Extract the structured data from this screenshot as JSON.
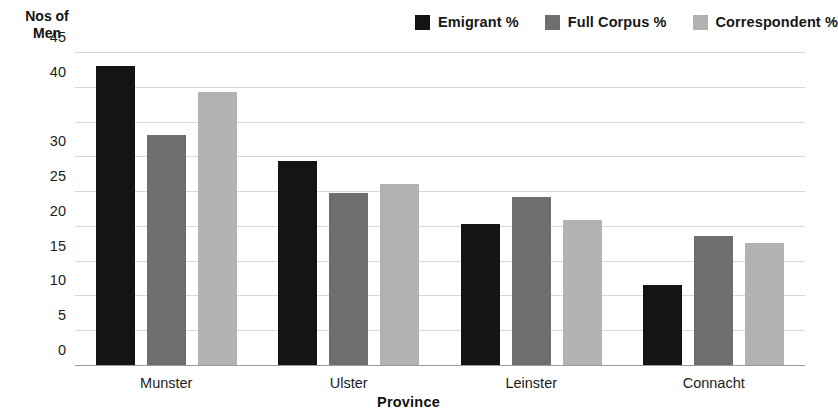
{
  "chart_data": {
    "type": "bar",
    "title": "",
    "xlabel": "Province",
    "ylabel": "Nos of Men",
    "ylabel_lines": [
      "Nos of",
      "Men"
    ],
    "categories": [
      "Munster",
      "Ulster",
      "Leinster",
      "Connacht"
    ],
    "series": [
      {
        "name": "Emigrant %",
        "color": "#141414",
        "values": [
          43.0,
          29.4,
          20.3,
          11.5
        ]
      },
      {
        "name": "Full Corpus %",
        "color": "#6e6e6e",
        "values": [
          33.0,
          24.8,
          24.2,
          18.5
        ]
      },
      {
        "name": "Correspondent %",
        "color": "#b2b2b2",
        "values": [
          39.3,
          26.0,
          20.8,
          17.5
        ]
      }
    ],
    "ylim": [
      0,
      45
    ],
    "yticks": [
      0,
      5,
      10,
      15,
      20,
      25,
      30,
      40,
      45
    ],
    "ytick_labels": [
      "0",
      "5",
      "10",
      "15",
      "20",
      "25",
      "30",
      "40",
      "45"
    ],
    "gridlines": [
      5,
      10,
      15,
      20,
      25,
      30,
      35,
      40,
      45
    ],
    "grid": true,
    "grid_color": "#d8d8d8",
    "legend_position": "top-right",
    "background": "#ffffff"
  },
  "legend": {
    "items": [
      {
        "label": "Emigrant %",
        "color": "#141414"
      },
      {
        "label": "Full Corpus %",
        "color": "#6e6e6e"
      },
      {
        "label": "Correspondent %",
        "color": "#b2b2b2"
      }
    ]
  }
}
